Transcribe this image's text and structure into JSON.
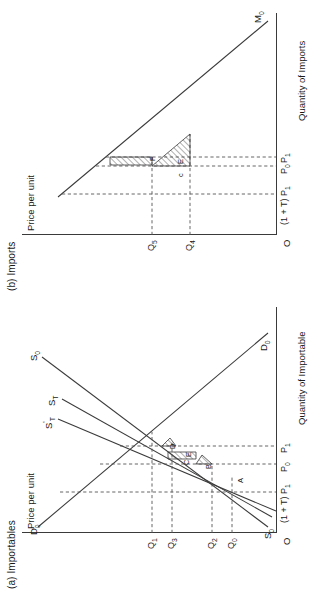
{
  "figure": {
    "orientation": "rotated-90-ccw",
    "panels": [
      {
        "id": "a",
        "title": "(a) Importables",
        "y_axis_label": "Price per unit",
        "x_axis_label": "Quantity of Importable",
        "origin_label": "O",
        "price_ticks": [
          "(1 + T) P",
          "P",
          "P"
        ],
        "price_ticks_full": [
          {
            "text": "(1 + T) P",
            "sub": "1"
          },
          {
            "text": "P",
            "sub": "0"
          },
          {
            "text": "P",
            "sub": "1"
          }
        ],
        "quantity_ticks": [
          {
            "text": "Q",
            "sub": "0"
          },
          {
            "text": "Q",
            "sub": "2"
          },
          {
            "text": "Q",
            "sub": "3"
          },
          {
            "text": "Q",
            "sub": "1"
          }
        ],
        "curves": [
          {
            "name": "D",
            "sub": "0",
            "sup": "",
            "position": "upper-left"
          },
          {
            "name": "D",
            "sub": "0",
            "sup": "",
            "position": "lower-right"
          },
          {
            "name": "S",
            "sub": "0",
            "sup": "",
            "position": "upper-left"
          },
          {
            "name": "S",
            "sub": "0",
            "sup": "",
            "position": "lower-left"
          },
          {
            "name": "S",
            "sub": "T",
            "sup": "",
            "position": "upper-mid"
          },
          {
            "name": "S",
            "sub": "T",
            "sup": "'",
            "position": "upper-mid"
          }
        ],
        "areas": [
          "A",
          "B",
          "C",
          "D",
          "E"
        ]
      },
      {
        "id": "b",
        "title": "(b) Imports",
        "y_axis_label": "Price per unit",
        "x_axis_label": "Quantity of Imports",
        "origin_label": "O",
        "price_ticks_full": [
          {
            "text": "(1 + T) P",
            "sub": "1"
          },
          {
            "text": "P",
            "sub": "0"
          },
          {
            "text": "P",
            "sub": "1"
          }
        ],
        "quantity_ticks": [
          {
            "text": "Q",
            "sub": "5"
          },
          {
            "text": "Q",
            "sub": "4"
          }
        ],
        "curves": [
          {
            "name": "M",
            "sub": "0",
            "sup": "",
            "position": "upper-right"
          }
        ],
        "areas": [
          "c",
          "E",
          "F"
        ]
      }
    ],
    "colors": {
      "line": "#3a3a3a",
      "dashed": "#555555",
      "background": "#ffffff",
      "text": "#1a1a1a"
    }
  }
}
